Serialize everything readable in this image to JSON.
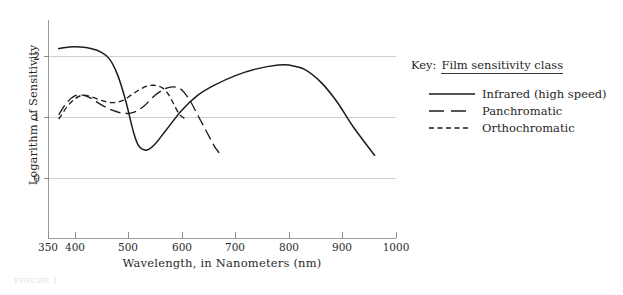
{
  "chart_data": {
    "type": "line",
    "title": "",
    "xlabel": "Wavelength, in Nanometers (nm)",
    "ylabel": "Logarithm of Sensitivity",
    "xlim": [
      350,
      1000
    ],
    "ylim": [
      -0.45,
      2.45
    ],
    "xticks": [
      350,
      400,
      500,
      600,
      700,
      800,
      900,
      1000
    ],
    "yticks": [
      0,
      1,
      2
    ],
    "grid": "horizontal",
    "legend_position": "right",
    "series": [
      {
        "name": "Infrared (high speed)",
        "style": "solid",
        "x": [
          370,
          390,
          410,
          430,
          450,
          465,
          480,
          495,
          510,
          520,
          535,
          550,
          570,
          600,
          630,
          660,
          700,
          740,
          780,
          800,
          830,
          860,
          890,
          920,
          960
        ],
        "y": [
          2.07,
          2.09,
          2.09,
          2.07,
          2.02,
          1.93,
          1.72,
          1.38,
          0.95,
          0.77,
          0.72,
          0.8,
          0.98,
          1.25,
          1.45,
          1.58,
          1.71,
          1.8,
          1.85,
          1.85,
          1.79,
          1.62,
          1.36,
          1.03,
          0.65
        ]
      },
      {
        "name": "Panchromatic",
        "style": "long-dash",
        "x": [
          370,
          385,
          400,
          415,
          430,
          450,
          470,
          490,
          510,
          530,
          550,
          570,
          585,
          600,
          615,
          630,
          645,
          660,
          670
        ],
        "y": [
          1.19,
          1.35,
          1.44,
          1.45,
          1.41,
          1.32,
          1.25,
          1.21,
          1.22,
          1.31,
          1.45,
          1.54,
          1.56,
          1.52,
          1.38,
          1.18,
          0.98,
          0.78,
          0.68
        ]
      },
      {
        "name": "Orthochromatic",
        "style": "short-dash",
        "x": [
          370,
          385,
          400,
          415,
          430,
          450,
          470,
          490,
          505,
          520,
          535,
          550,
          565,
          575,
          585,
          595,
          605
        ],
        "y": [
          1.13,
          1.29,
          1.4,
          1.45,
          1.43,
          1.38,
          1.35,
          1.38,
          1.45,
          1.52,
          1.57,
          1.58,
          1.54,
          1.46,
          1.33,
          1.2,
          1.14
        ]
      }
    ],
    "colors": {
      "curve": "#1c1c1c",
      "grid": "#cfcfcf",
      "axis": "#9a9a9a",
      "text": "#2b2b2b"
    }
  },
  "legend": {
    "key_label": "Key:",
    "title": "Film sensitivity class",
    "entries": [
      {
        "label": "Infrared (high speed)",
        "dash": "solid"
      },
      {
        "label": "Panchromatic",
        "dash": "long-dash"
      },
      {
        "label": "Orthochromatic",
        "dash": "short-dash"
      }
    ]
  },
  "caption": {
    "text": "FIGURE 1"
  }
}
